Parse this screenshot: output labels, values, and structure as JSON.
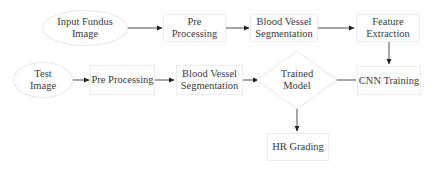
{
  "diagram": {
    "type": "flowchart",
    "nodes": {
      "input_fundus_image": {
        "label": "Input Fundus\nImage",
        "shape": "ellipse"
      },
      "pre_processing_train": {
        "label": "Pre Processing",
        "shape": "rectangle"
      },
      "blood_vessel_segmentation_train": {
        "label": "Blood Vessel\nSegmentation",
        "shape": "rectangle"
      },
      "feature_extraction": {
        "label": "Feature\nExtraction",
        "shape": "rectangle"
      },
      "cnn_training": {
        "label": "CNN Training",
        "shape": "rectangle"
      },
      "test_image": {
        "label": "Test\nImage",
        "shape": "ellipse"
      },
      "pre_processing_test": {
        "label": "Pre Processing",
        "shape": "rectangle"
      },
      "blood_vessel_segmentation_test": {
        "label": "Blood Vessel\nSegmentation",
        "shape": "rectangle"
      },
      "trained_model": {
        "label": "Trained\nModel",
        "shape": "diamond"
      },
      "hr_grading": {
        "label": "HR Grading",
        "shape": "rectangle"
      }
    },
    "edges": [
      {
        "from": "input_fundus_image",
        "to": "pre_processing_train"
      },
      {
        "from": "pre_processing_train",
        "to": "blood_vessel_segmentation_train"
      },
      {
        "from": "blood_vessel_segmentation_train",
        "to": "feature_extraction"
      },
      {
        "from": "feature_extraction",
        "to": "cnn_training"
      },
      {
        "from": "cnn_training",
        "to": "trained_model"
      },
      {
        "from": "test_image",
        "to": "pre_processing_test"
      },
      {
        "from": "pre_processing_test",
        "to": "blood_vessel_segmentation_test"
      },
      {
        "from": "blood_vessel_segmentation_test",
        "to": "trained_model"
      },
      {
        "from": "trained_model",
        "to": "hr_grading"
      }
    ],
    "colors": {
      "node_border": "#e6e6e6",
      "edge": "#222222",
      "text": "#3a3a3a",
      "background": "#ffffff"
    }
  }
}
